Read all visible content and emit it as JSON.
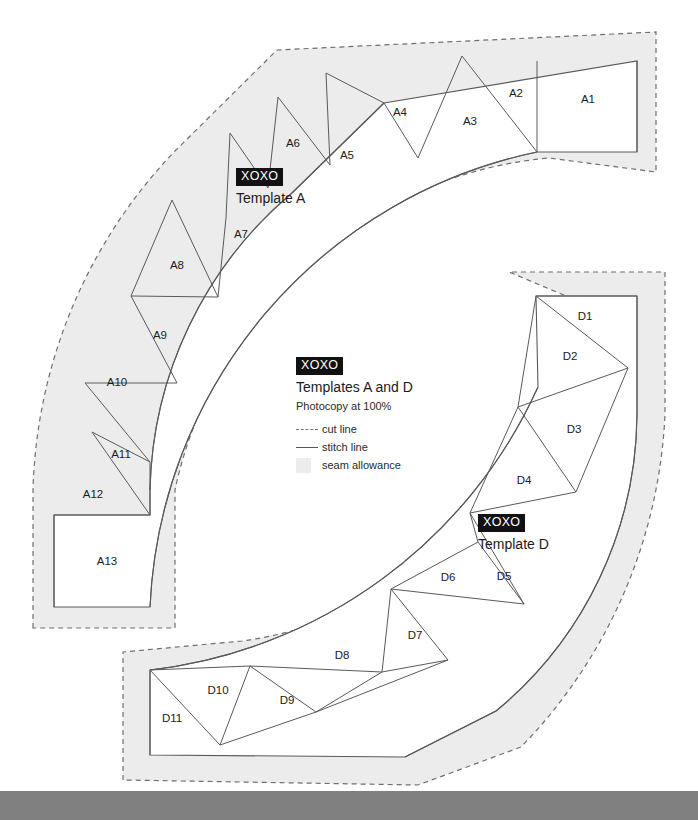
{
  "document": {
    "kind": "quilt-template-sheet",
    "background": "#ffffff",
    "bottom_bar_color": "#808080"
  },
  "legend": {
    "brand": "XOXO",
    "title": "Templates A and D",
    "subtitle": "Photocopy at 100%",
    "items": [
      {
        "key": "cut-line",
        "label": "cut line",
        "style": "dashed",
        "color": "#777777"
      },
      {
        "key": "stitch-line",
        "label": "stitch line",
        "style": "solid",
        "color": "#555555"
      },
      {
        "key": "seam-allowance",
        "label": "seam allowance",
        "style": "swatch",
        "color": "#ececec"
      }
    ]
  },
  "template_a": {
    "brand": "XOXO",
    "name": "Template A",
    "pieces": [
      "A1",
      "A2",
      "A3",
      "A4",
      "A5",
      "A6",
      "A7",
      "A8",
      "A9",
      "A10",
      "A11",
      "A12",
      "A13"
    ],
    "piece_count": 13
  },
  "template_d": {
    "brand": "XOXO",
    "name": "Template D",
    "pieces": [
      "D1",
      "D2",
      "D3",
      "D4",
      "D5",
      "D6",
      "D7",
      "D8",
      "D9",
      "D10",
      "D11"
    ],
    "piece_count": 11
  },
  "colors": {
    "seam_allowance_fill": "#ececec",
    "seam_allowance_stroke": "#9a9a9a",
    "cut_line": "#6f6f6f",
    "stitch_line": "#5a5a5a",
    "piece_fill": "#ffffff",
    "label_text": "#1b1b1b"
  },
  "geometry": {
    "arc_a": {
      "cx": 637,
      "cy": 607,
      "r_inner": 399,
      "r_outer": 487,
      "start_deg": 90,
      "end_deg": 180
    },
    "arc_d": {
      "cx": 150,
      "cy": 296,
      "r_inner": 388,
      "r_outer": 474,
      "start_deg": 270,
      "end_deg": 360
    },
    "seam_allowance_px": 22
  },
  "piece_labels_a": [
    {
      "t": "A1",
      "x": 588,
      "y": 100
    },
    {
      "t": "A2",
      "x": 516,
      "y": 94
    },
    {
      "t": "A3",
      "x": 470,
      "y": 122
    },
    {
      "t": "A4",
      "x": 400,
      "y": 113
    },
    {
      "t": "A5",
      "x": 347,
      "y": 156
    },
    {
      "t": "A6",
      "x": 293,
      "y": 144
    },
    {
      "t": "A7",
      "x": 241,
      "y": 235
    },
    {
      "t": "A8",
      "x": 177,
      "y": 266
    },
    {
      "t": "A9",
      "x": 160,
      "y": 336
    },
    {
      "t": "A10",
      "x": 117,
      "y": 383
    },
    {
      "t": "A11",
      "x": 121,
      "y": 455
    },
    {
      "t": "A12",
      "x": 93,
      "y": 495
    },
    {
      "t": "A13",
      "x": 107,
      "y": 562
    }
  ],
  "piece_labels_d": [
    {
      "t": "D1",
      "x": 585,
      "y": 317
    },
    {
      "t": "D2",
      "x": 570,
      "y": 357
    },
    {
      "t": "D3",
      "x": 574,
      "y": 430
    },
    {
      "t": "D4",
      "x": 524,
      "y": 481
    },
    {
      "t": "D5",
      "x": 504,
      "y": 577
    },
    {
      "t": "D6",
      "x": 448,
      "y": 578
    },
    {
      "t": "D7",
      "x": 415,
      "y": 636
    },
    {
      "t": "D8",
      "x": 342,
      "y": 656
    },
    {
      "t": "D9",
      "x": 287,
      "y": 701
    },
    {
      "t": "D10",
      "x": 218,
      "y": 691
    },
    {
      "t": "D11",
      "x": 172,
      "y": 719
    }
  ]
}
